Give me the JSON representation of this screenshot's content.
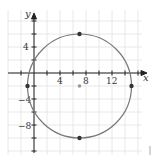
{
  "chart_data": {
    "type": "scatter",
    "title": "",
    "xlabel": "x",
    "ylabel": "y",
    "xlim": [
      -3,
      16
    ],
    "ylim": [
      -13,
      10
    ],
    "grid": true,
    "grid_step": 2,
    "x_ticks": [
      4,
      8,
      12
    ],
    "y_ticks": [
      4,
      -4,
      -8
    ],
    "x_tick_labels": [
      "4",
      "8",
      "12"
    ],
    "y_tick_labels": [
      "4",
      "−4",
      "−8"
    ],
    "circle": {
      "center": [
        7,
        -2
      ],
      "radius": 8
    },
    "points": [
      {
        "x": 7,
        "y": 6,
        "role": "top"
      },
      {
        "x": 7,
        "y": -10,
        "role": "bottom"
      },
      {
        "x": -1,
        "y": -2,
        "role": "left"
      },
      {
        "x": 15,
        "y": -2,
        "role": "right"
      },
      {
        "x": 7,
        "y": -2,
        "role": "center"
      }
    ],
    "colors": {
      "circle": "#777777",
      "point": "#333333",
      "center_point": "#999999",
      "grid": "#dddddd",
      "axis": "#222222"
    }
  },
  "labels": {
    "x_axis": "x",
    "y_axis": "y",
    "xt4": "4",
    "xt8": "8",
    "xt12": "12",
    "yt4": "4",
    "ytm4": "−4",
    "ytm8": "−8"
  }
}
